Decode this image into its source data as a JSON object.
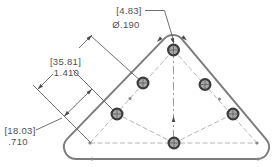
{
  "drawing": {
    "type": "cad-dimension-view",
    "part": "rounded-triangle-plate-with-6-hole-pattern",
    "hole_callout": {
      "metric": "[4.83]",
      "imperial": "Ø.190"
    },
    "dim_pitch_double": {
      "metric": "[35.81]",
      "imperial": "1.410"
    },
    "dim_pitch_single": {
      "metric": "[18.03]",
      "imperial": ".710"
    },
    "hole_count": 6,
    "colors": {
      "background": "#ffffff",
      "outline": "#7d7d7d",
      "dimension_lines": "#5f5f5f",
      "pattern_centerlines": "#b5b5b5",
      "text": "#4f4f4f",
      "hole_ring": "#3c3c3c"
    }
  }
}
